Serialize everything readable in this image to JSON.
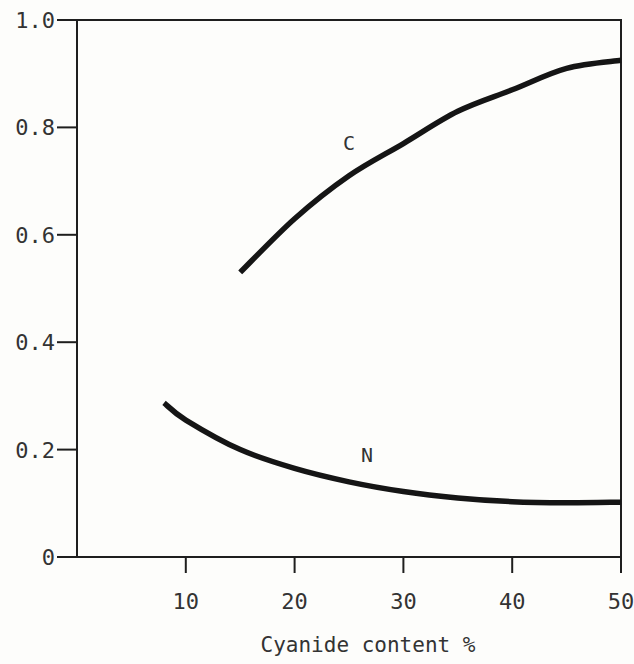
{
  "chart_data": {
    "type": "line",
    "title": "",
    "xlabel": "Cyanide content %",
    "ylabel": "",
    "xlim": [
      0,
      50
    ],
    "ylim": [
      0,
      1.0
    ],
    "grid": false,
    "legend": "none (curves labeled inline)",
    "x_ticks": [
      "10",
      "20",
      "30",
      "40",
      "50"
    ],
    "y_ticks": [
      "0",
      "0.2",
      "0.4",
      "0.6",
      "0.8",
      "1.0"
    ],
    "series": [
      {
        "name": "C",
        "x": [
          15,
          20,
          25,
          30,
          35,
          40,
          45,
          50
        ],
        "y": [
          0.53,
          0.63,
          0.71,
          0.77,
          0.83,
          0.87,
          0.91,
          0.925
        ]
      },
      {
        "name": "N",
        "x": [
          8,
          10,
          15,
          20,
          25,
          30,
          35,
          40,
          45,
          50
        ],
        "y": [
          0.287,
          0.255,
          0.2,
          0.165,
          0.14,
          0.122,
          0.11,
          0.103,
          0.101,
          0.102
        ]
      }
    ],
    "annotations": [
      {
        "text": "C",
        "x": 25,
        "y": 0.78
      },
      {
        "text": "N",
        "x": 27,
        "y": 0.2
      }
    ]
  }
}
